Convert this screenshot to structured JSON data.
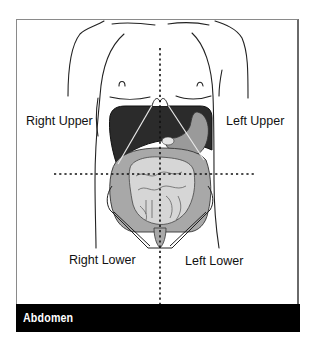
{
  "figure": {
    "caption": "Abdomen",
    "quadrants": {
      "right_upper": "Right Upper",
      "left_upper": "Left Upper",
      "right_lower": "Right Lower",
      "left_lower": "Left Lower"
    },
    "colors": {
      "frame": "#8a8a8a",
      "banner_bg": "#000000",
      "banner_text": "#ffffff",
      "liver": "#2b2b2b",
      "stomach": "#9a9a9a",
      "intestine_large": "#a8a8a8",
      "intestine_small": "#d6d6d6",
      "outline": "#222222"
    }
  }
}
